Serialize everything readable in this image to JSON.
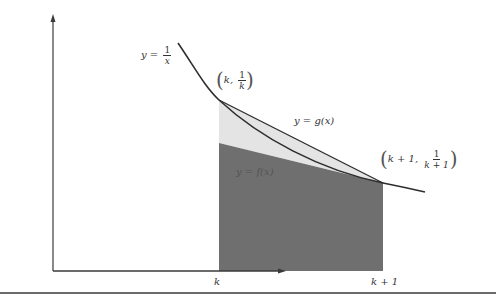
{
  "diagram": {
    "curve_label": {
      "lhs": "y =",
      "num": "1",
      "den": "x"
    },
    "point_left": {
      "x": "k",
      "num": "1",
      "den": "k"
    },
    "point_right": {
      "x": "k + 1,",
      "num": "1",
      "den": "k + 1"
    },
    "secant_label": "y = g(x)",
    "lower_label": "y = f(x)",
    "x_ticks": [
      "k",
      "k + 1"
    ],
    "colors": {
      "axis": "#3a3a3a",
      "curve": "#2e2e2e",
      "light_region": "#e6e6e6",
      "dark_region": "#6e6e6e",
      "rule": "#6b6b6b"
    }
  }
}
